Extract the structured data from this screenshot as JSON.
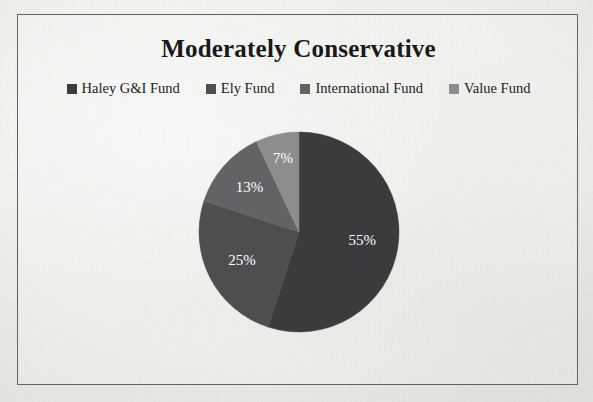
{
  "chart_data": {
    "type": "pie",
    "title": "Moderately Conservative",
    "categories": [
      "Haley G&I Fund",
      "Ely Fund",
      "International Fund",
      "Value Fund"
    ],
    "values": [
      55,
      25,
      13,
      7
    ],
    "data_labels": [
      "55%",
      "25%",
      "13%",
      "7%"
    ],
    "units": "percent",
    "start_angle_deg": 0,
    "direction": "clockwise",
    "legend_position": "top",
    "grid": false,
    "colors": [
      "#3b3b3d",
      "#4e4e50",
      "#636365",
      "#8d8d8e"
    ]
  },
  "chart": {
    "title": "Moderately Conservative",
    "legend": [
      {
        "label": "Haley G&I Fund",
        "color": "#3b3b3d"
      },
      {
        "label": "Ely Fund",
        "color": "#4e4e50"
      },
      {
        "label": "International Fund",
        "color": "#636365"
      },
      {
        "label": "Value Fund",
        "color": "#8d8d8e"
      }
    ],
    "slices": [
      {
        "name": "Haley G&I Fund",
        "label": "55%",
        "value": 55,
        "color": "#3b3b3d"
      },
      {
        "name": "Ely Fund",
        "label": "25%",
        "value": 25,
        "color": "#4e4e50"
      },
      {
        "name": "International Fund",
        "label": "13%",
        "value": 13,
        "color": "#636365"
      },
      {
        "name": "Value Fund",
        "label": "7%",
        "value": 7,
        "color": "#8d8d8e"
      }
    ]
  }
}
